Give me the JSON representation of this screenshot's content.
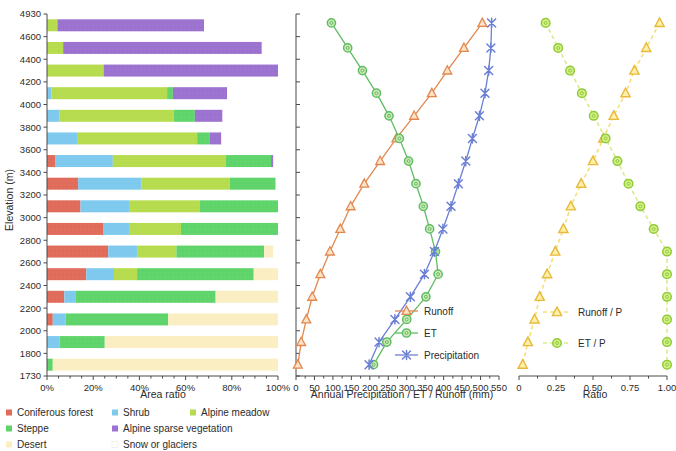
{
  "figure": {
    "title": "",
    "panels": [
      "vegetation-area-ratio",
      "water-balance",
      "ratio"
    ]
  },
  "axes": {
    "elevation_label": "Elevation (m)",
    "elevation_ticks": [
      "4930",
      "4600",
      "4400",
      "4200",
      "4000",
      "3800",
      "3600",
      "3400",
      "3200",
      "3000",
      "2800",
      "2600",
      "2400",
      "2200",
      "2000",
      "1800",
      "1730"
    ],
    "left_xlabel": "Area ratio",
    "left_xticks": [
      "0%",
      "20%",
      "40%",
      "60%",
      "80%",
      "100%"
    ],
    "mid_xlabel": "Annual Precipitation / ET / Runoff (mm)",
    "mid_xticks": [
      "0",
      "50",
      "100",
      "150",
      "200",
      "250",
      "300",
      "350",
      "400",
      "450",
      "500",
      "550"
    ],
    "right_xlabel": "Ratio",
    "right_xticks": [
      "0",
      "0.25",
      "0.50",
      "0.75",
      "1.00"
    ]
  },
  "colors": {
    "coniferous_forest": "#e06b5a",
    "shrub": "#7ec9ee",
    "alpine_meadow": "#b6dc4e",
    "steppe": "#5fd46a",
    "alpine_sparse_vegetation": "#9b72d0",
    "desert": "#fbeec2",
    "snow_or_glaciers": "#ffffff",
    "runoff": "#e2884f",
    "et": "#5fbd62",
    "precipitation": "#6b7fd4",
    "runoff_p": "#f2d24a",
    "et_p": "#c9e35a"
  },
  "veg_legend": [
    {
      "label": "Coniferous forest",
      "key": "coniferous_forest"
    },
    {
      "label": "Shrub",
      "key": "shrub"
    },
    {
      "label": "Alpine meadow",
      "key": "alpine_meadow"
    },
    {
      "label": "Steppe",
      "key": "steppe"
    },
    {
      "label": "Alpine sparse vegetation",
      "key": "alpine_sparse_vegetation"
    },
    {
      "label": "Desert",
      "key": "desert"
    },
    {
      "label": "Snow or glaciers",
      "key": "snow_or_glaciers"
    }
  ],
  "mid_legend": [
    {
      "label": "Runoff",
      "key": "runoff",
      "marker": "triangle"
    },
    {
      "label": "ET",
      "key": "et",
      "marker": "circle"
    },
    {
      "label": "Precipitation",
      "key": "precipitation",
      "marker": "cross"
    }
  ],
  "right_legend": [
    {
      "label": "Runoff / P",
      "key": "runoff_p",
      "marker": "triangle"
    },
    {
      "label": "ET / P",
      "key": "et_p",
      "marker": "circle"
    }
  ],
  "chart_data": [
    {
      "type": "bar",
      "orientation": "horizontal",
      "stacked": true,
      "title": "Vegetation area ratio by elevation band",
      "xlabel": "Area ratio",
      "ylabel": "Elevation (m)",
      "xlim": [
        0,
        100
      ],
      "xtick_values": [
        0,
        20,
        40,
        60,
        80,
        100
      ],
      "xtick_labels": [
        "0%",
        "20%",
        "40%",
        "60%",
        "80%",
        "100%"
      ],
      "grid": false,
      "categories": [
        "4800",
        "4500",
        "4300",
        "4100",
        "3900",
        "3700",
        "3500",
        "3300",
        "3100",
        "2900",
        "2700",
        "2500",
        "2300",
        "2100",
        "1900",
        "1765"
      ],
      "series": [
        {
          "name": "Coniferous forest",
          "values": [
            0,
            0,
            0,
            0,
            0,
            0,
            3.5,
            13.5,
            14.5,
            24.5,
            26.5,
            17.0,
            7.5,
            2.5,
            0,
            0
          ]
        },
        {
          "name": "Shrub",
          "values": [
            0,
            0,
            0,
            2.0,
            5.5,
            13.0,
            25.0,
            27.5,
            21.0,
            11.0,
            12.5,
            12.0,
            5.0,
            5.5,
            5.5,
            0
          ]
        },
        {
          "name": "Alpine meadow",
          "values": [
            4.5,
            7.0,
            24.5,
            50.0,
            49.5,
            52.0,
            49.0,
            38.0,
            30.5,
            22.5,
            17.0,
            10.0,
            0,
            0,
            0,
            0
          ]
        },
        {
          "name": "Steppe",
          "values": [
            0,
            0,
            0,
            2.5,
            9.0,
            5.5,
            19.5,
            20.0,
            34.0,
            42.0,
            38.0,
            50.5,
            60.5,
            44.5,
            19.5,
            2.5
          ]
        },
        {
          "name": "Alpine sparse vegetation",
          "values": [
            63.5,
            86.0,
            75.5,
            23.5,
            12.0,
            5.0,
            1.0,
            0,
            0,
            0,
            0,
            0,
            0,
            0,
            0,
            0
          ]
        },
        {
          "name": "Desert",
          "values": [
            0,
            0,
            0,
            0,
            0,
            0,
            0,
            0,
            0,
            0,
            4.0,
            10.5,
            27.0,
            47.5,
            75.0,
            97.5
          ]
        },
        {
          "name": "Snow or glaciers",
          "values": [
            32.0,
            7.0,
            0,
            22.0,
            24.0,
            24.5,
            2.0,
            1.0,
            0,
            0,
            2.0,
            0,
            0,
            0,
            0,
            0
          ]
        }
      ]
    },
    {
      "type": "line",
      "title": "Annual water balance by elevation",
      "xlabel": "Annual Precipitation / ET / Runoff (mm)",
      "ylabel": "Elevation (m)",
      "xlim": [
        0,
        550
      ],
      "ylim": [
        1730,
        4930
      ],
      "xtick_values": [
        0,
        50,
        100,
        150,
        200,
        250,
        300,
        350,
        400,
        450,
        500,
        550
      ],
      "grid": false,
      "legend_position": "lower right",
      "y": [
        4800,
        4500,
        4300,
        4100,
        3900,
        3700,
        3500,
        3300,
        3100,
        2900,
        2700,
        2500,
        2300,
        2100,
        1900,
        1765
      ],
      "series": [
        {
          "name": "Runoff",
          "marker": "triangle",
          "values": [
            505,
            455,
            410,
            368,
            320,
            272,
            228,
            185,
            148,
            120,
            92,
            66,
            44,
            28,
            14,
            5
          ]
        },
        {
          "name": "ET",
          "marker": "circle",
          "values": [
            96,
            140,
            180,
            218,
            252,
            280,
            305,
            325,
            345,
            362,
            378,
            385,
            352,
            300,
            246,
            210
          ]
        },
        {
          "name": "Precipitation",
          "marker": "cross",
          "values": [
            530,
            528,
            522,
            512,
            497,
            478,
            460,
            440,
            420,
            398,
            375,
            348,
            310,
            268,
            225,
            198
          ]
        }
      ]
    },
    {
      "type": "line",
      "title": "Runoff and ET ratios to precipitation",
      "xlabel": "Ratio",
      "ylabel": "Elevation (m)",
      "xlim": [
        0,
        1.0
      ],
      "ylim": [
        1730,
        4930
      ],
      "xtick_values": [
        0,
        0.25,
        0.5,
        0.75,
        1.0
      ],
      "xtick_labels": [
        "0",
        "0.25",
        "0.50",
        "0.75",
        "1.00"
      ],
      "grid": false,
      "legend_position": "lower center",
      "y": [
        4800,
        4500,
        4300,
        4100,
        3900,
        3700,
        3500,
        3300,
        3100,
        2900,
        2700,
        2500,
        2300,
        2100,
        1900,
        1765
      ],
      "series": [
        {
          "name": "Runoff / P",
          "marker": "triangle",
          "values": [
            0.95,
            0.86,
            0.78,
            0.72,
            0.64,
            0.57,
            0.5,
            0.42,
            0.35,
            0.3,
            0.245,
            0.19,
            0.14,
            0.105,
            0.06,
            0.025
          ]
        },
        {
          "name": "ET / P",
          "marker": "circle",
          "values": [
            0.18,
            0.265,
            0.345,
            0.425,
            0.505,
            0.585,
            0.665,
            0.74,
            0.82,
            0.91,
            1.01,
            1.11,
            1.135,
            1.12,
            1.09,
            1.06
          ]
        }
      ]
    }
  ]
}
